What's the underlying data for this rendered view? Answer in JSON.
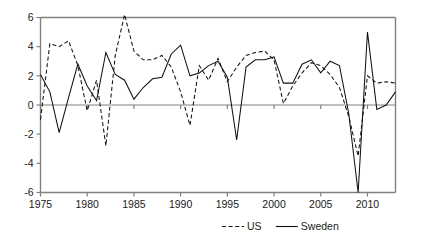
{
  "chart_data": {
    "type": "line",
    "title": "",
    "subtitle": "",
    "xlabel": "",
    "ylabel": "",
    "xlim": [
      1975,
      2013
    ],
    "ylim": [
      -6,
      6
    ],
    "grid": false,
    "legend_position": "bottom-right",
    "y_ticks": [
      6,
      4,
      2,
      0,
      -2,
      -4,
      -6
    ],
    "y_tick_labels": [
      "6",
      "4",
      "2",
      "0",
      "-2",
      "-4",
      "-6"
    ],
    "x_ticks": [
      1975,
      1980,
      1985,
      1990,
      1995,
      2000,
      2005,
      2010
    ],
    "x_tick_labels": [
      "1975",
      "1980",
      "1985",
      "1990",
      "1995",
      "2000",
      "2005",
      "2010"
    ],
    "x": [
      1975,
      1976,
      1977,
      1978,
      1979,
      1980,
      1981,
      1982,
      1983,
      1984,
      1985,
      1986,
      1987,
      1988,
      1989,
      1990,
      1991,
      1992,
      1993,
      1994,
      1995,
      1996,
      1997,
      1998,
      1999,
      2000,
      2001,
      2002,
      2003,
      2004,
      2005,
      2006,
      2007,
      2008,
      2009,
      2010,
      2011,
      2012,
      2013
    ],
    "series": [
      {
        "name": "US",
        "style": "dashed",
        "color": "#111111",
        "values": [
          -1.0,
          4.2,
          4.0,
          4.4,
          2.7,
          -0.4,
          1.7,
          -2.8,
          3.4,
          6.2,
          3.7,
          3.1,
          3.1,
          3.4,
          2.6,
          0.9,
          -1.4,
          2.7,
          1.7,
          3.2,
          1.6,
          2.6,
          3.4,
          3.6,
          3.7,
          3.1,
          0.1,
          1.3,
          2.2,
          2.9,
          2.7,
          2.1,
          1.2,
          -0.8,
          -3.5,
          2.0,
          1.5,
          1.6,
          1.5
        ]
      },
      {
        "name": "Sweden",
        "style": "solid",
        "color": "#111111",
        "values": [
          2.1,
          0.9,
          -1.9,
          0.5,
          2.8,
          1.3,
          0.3,
          3.6,
          2.1,
          1.7,
          0.4,
          1.2,
          1.8,
          1.9,
          3.5,
          4.1,
          2.0,
          2.2,
          2.7,
          3.0,
          1.9,
          -2.4,
          2.6,
          3.1,
          3.1,
          3.3,
          1.5,
          1.5,
          2.8,
          3.1,
          2.2,
          3.0,
          2.7,
          -0.6,
          -6.0,
          5.0,
          -0.3,
          0.0,
          0.9
        ]
      }
    ],
    "legend": [
      {
        "label": "US",
        "style": "dashed"
      },
      {
        "label": "Sweden",
        "style": "solid"
      }
    ]
  }
}
